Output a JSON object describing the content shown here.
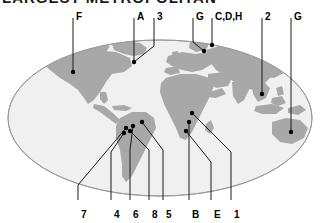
{
  "title": {
    "text": "LARGEST METROPOLITAN",
    "clipped": true
  },
  "map": {
    "projection": "ellipse-world",
    "ocean_color": "#f0f0f0",
    "land_color": "#a8a8a8",
    "outline_color": "#9a9a9a",
    "leader_color": "#1a1a1a",
    "marker_color": "#000000",
    "background_color": "#ffffff"
  },
  "top_labels": [
    {
      "id": "label-F",
      "text": "F",
      "x": 76,
      "y": 11
    },
    {
      "id": "label-A",
      "text": "A",
      "x": 137,
      "y": 11
    },
    {
      "id": "label-3",
      "text": "3",
      "x": 157,
      "y": 11
    },
    {
      "id": "label-G1",
      "text": "G",
      "x": 196,
      "y": 11
    },
    {
      "id": "label-CDH",
      "text": "C,D,H",
      "x": 215,
      "y": 11
    },
    {
      "id": "label-2",
      "text": "2",
      "x": 265,
      "y": 11
    },
    {
      "id": "label-G2",
      "text": "G",
      "x": 294,
      "y": 11
    }
  ],
  "bottom_labels": [
    {
      "id": "label-7",
      "text": "7",
      "x": 81,
      "y": 209
    },
    {
      "id": "label-4",
      "text": "4",
      "x": 114,
      "y": 209
    },
    {
      "id": "label-6",
      "text": "6",
      "x": 133,
      "y": 209
    },
    {
      "id": "label-8",
      "text": "8",
      "x": 152,
      "y": 209
    },
    {
      "id": "label-5",
      "text": "5",
      "x": 166,
      "y": 209
    },
    {
      "id": "label-B",
      "text": "B",
      "x": 192,
      "y": 209
    },
    {
      "id": "label-E",
      "text": "E",
      "x": 214,
      "y": 209
    },
    {
      "id": "label-1",
      "text": "1",
      "x": 234,
      "y": 209
    }
  ],
  "leaders": [
    {
      "id": "leader-F",
      "label": "F",
      "path": "M73,18 L73,72",
      "dot": [
        73,
        72
      ]
    },
    {
      "id": "leader-A",
      "label": "A",
      "path": "M134,18 L134,62",
      "dot": null
    },
    {
      "id": "leader-3",
      "label": "3",
      "path": "M154,18 L154,46 L134,62",
      "dot": [
        134,
        62
      ]
    },
    {
      "id": "leader-G1",
      "label": "G",
      "path": "M193,18 L193,42 L204,51",
      "dot": [
        204,
        51
      ]
    },
    {
      "id": "leader-CDH",
      "label": "C,D,H",
      "path": "M212,18 L212,45",
      "dot": [
        212,
        45
      ]
    },
    {
      "id": "leader-2",
      "label": "2",
      "path": "M262,18 L262,94",
      "dot": [
        262,
        94
      ]
    },
    {
      "id": "leader-G2",
      "label": "G",
      "path": "M291,18 L291,132",
      "dot": [
        291,
        132
      ]
    },
    {
      "id": "leader-7",
      "label": "7",
      "path": "M78,200 L78,185 L126,128",
      "dot": [
        126,
        128
      ]
    },
    {
      "id": "leader-4",
      "label": "4",
      "path": "M111,200 L111,152 L124,133",
      "dot": [
        124,
        133
      ]
    },
    {
      "id": "leader-6",
      "label": "6",
      "path": "M130,200 L130,150 L133,126",
      "dot": [
        133,
        126
      ]
    },
    {
      "id": "leader-8",
      "label": "8",
      "path": "M149,200 L149,150 L130,131",
      "dot": [
        130,
        131
      ]
    },
    {
      "id": "leader-5",
      "label": "5",
      "path": "M163,200 L163,150 L142,122",
      "dot": [
        142,
        122
      ]
    },
    {
      "id": "leader-B",
      "label": "B",
      "path": "M189,200 L189,150 L189,122",
      "dot": [
        189,
        122
      ]
    },
    {
      "id": "leader-E",
      "label": "E",
      "path": "M211,200 L211,162 L186,131",
      "dot": [
        186,
        131
      ]
    },
    {
      "id": "leader-1",
      "label": "1",
      "path": "M231,200 L231,152 L192,113",
      "dot": [
        192,
        113
      ]
    }
  ]
}
